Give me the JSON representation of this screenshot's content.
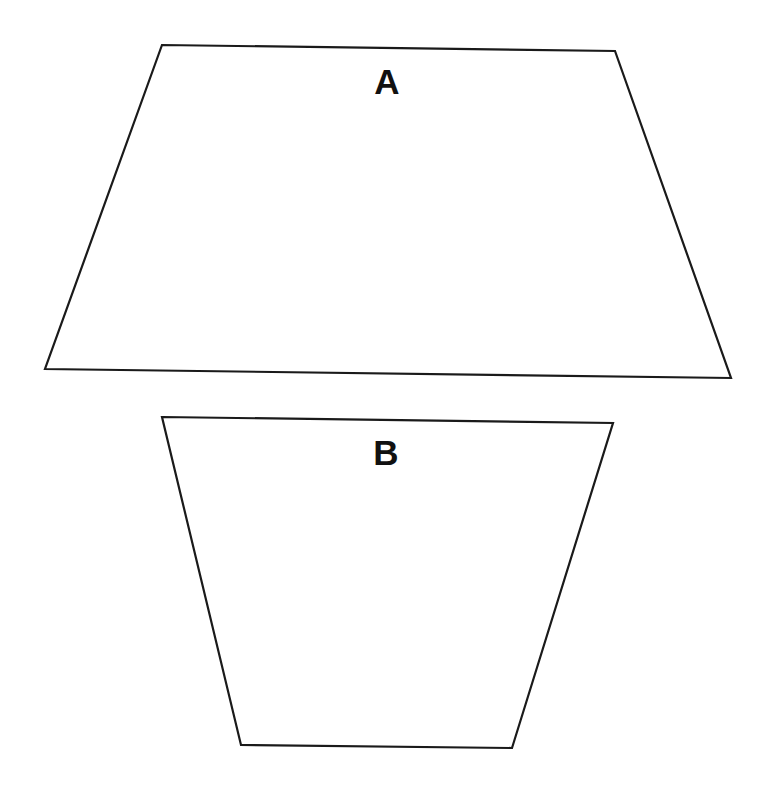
{
  "diagram": {
    "background": "#ffffff",
    "stroke_color": "#1a1a1a",
    "shapes": [
      {
        "id": "A",
        "type": "trapezoid",
        "label": "A",
        "points": [
          [
            162,
            45
          ],
          [
            615,
            51
          ],
          [
            731,
            378
          ],
          [
            45,
            369
          ]
        ],
        "label_position": [
          387,
          94
        ]
      },
      {
        "id": "B",
        "type": "trapezoid",
        "label": "B",
        "points": [
          [
            162,
            417
          ],
          [
            613,
            423
          ],
          [
            512,
            748
          ],
          [
            241,
            745
          ]
        ],
        "label_position": [
          386,
          465
        ]
      }
    ]
  }
}
